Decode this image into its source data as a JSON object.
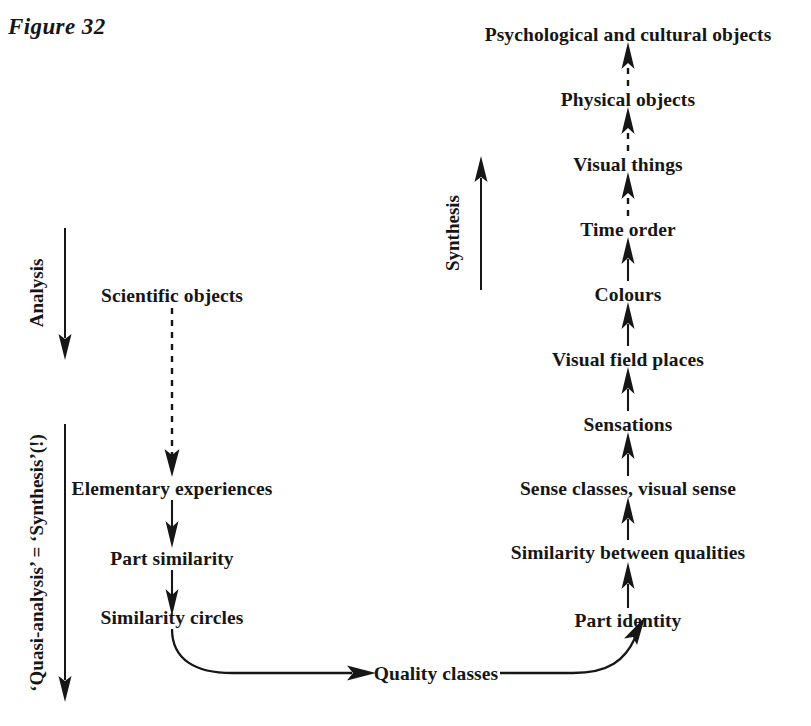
{
  "figure": {
    "title": "Figure 32",
    "background_color": "#ffffff",
    "ink_color": "#161616"
  },
  "axis_captions": [
    {
      "id": "analysis",
      "label": "Analysis",
      "direction": "down",
      "arrow_style": "solid"
    },
    {
      "id": "quasi-analysis",
      "label": "‘Quasi-analysis’ = ‘Synthesis’(!)",
      "direction": "down",
      "arrow_style": "solid"
    },
    {
      "id": "synthesis",
      "label": "Synthesis",
      "direction": "up",
      "arrow_style": "solid"
    }
  ],
  "left_column": {
    "name": "analysis-chain",
    "nodes": [
      {
        "id": "scientific-objects",
        "label": "Scientific objects"
      },
      {
        "id": "elementary-experiences",
        "label": "Elementary experiences"
      },
      {
        "id": "part-similarity",
        "label": "Part similarity"
      },
      {
        "id": "similarity-circles",
        "label": "Similarity circles"
      }
    ],
    "edges": [
      {
        "from": "scientific-objects",
        "to": "elementary-experiences",
        "style": "dashed",
        "direction": "down"
      },
      {
        "from": "elementary-experiences",
        "to": "part-similarity",
        "style": "solid",
        "direction": "down"
      },
      {
        "from": "part-similarity",
        "to": "similarity-circles",
        "style": "solid",
        "direction": "down"
      }
    ]
  },
  "bridge": {
    "node": {
      "id": "quality-classes",
      "label": "Quality classes"
    },
    "edges": [
      {
        "from": "similarity-circles",
        "to": "quality-classes",
        "style": "solid",
        "direction": "curve-right"
      },
      {
        "from": "quality-classes",
        "to": "part-identity",
        "style": "solid",
        "direction": "curve-up-right"
      }
    ]
  },
  "right_column": {
    "name": "synthesis-chain",
    "nodes": [
      {
        "id": "part-identity",
        "label": "Part identity"
      },
      {
        "id": "similarity-between-qualities",
        "label": "Similarity between qualities"
      },
      {
        "id": "sense-classes-visual-sense",
        "label": "Sense classes, visual sense"
      },
      {
        "id": "sensations",
        "label": "Sensations"
      },
      {
        "id": "visual-field-places",
        "label": "Visual field places"
      },
      {
        "id": "colours",
        "label": "Colours"
      },
      {
        "id": "time-order",
        "label": "Time order"
      },
      {
        "id": "visual-things",
        "label": "Visual things"
      },
      {
        "id": "physical-objects",
        "label": "Physical objects"
      },
      {
        "id": "psychological-and-cultural-objects",
        "label": "Psychological and cultural objects"
      }
    ],
    "edges": [
      {
        "from": "part-identity",
        "to": "similarity-between-qualities",
        "style": "solid",
        "direction": "up"
      },
      {
        "from": "similarity-between-qualities",
        "to": "sense-classes-visual-sense",
        "style": "solid",
        "direction": "up"
      },
      {
        "from": "sense-classes-visual-sense",
        "to": "sensations",
        "style": "solid",
        "direction": "up"
      },
      {
        "from": "sensations",
        "to": "visual-field-places",
        "style": "solid",
        "direction": "up"
      },
      {
        "from": "visual-field-places",
        "to": "colours",
        "style": "solid",
        "direction": "up"
      },
      {
        "from": "colours",
        "to": "time-order",
        "style": "solid",
        "direction": "up"
      },
      {
        "from": "time-order",
        "to": "visual-things",
        "style": "dashed",
        "direction": "up"
      },
      {
        "from": "visual-things",
        "to": "physical-objects",
        "style": "dashed",
        "direction": "up"
      },
      {
        "from": "physical-objects",
        "to": "psychological-and-cultural-objects",
        "style": "dashed",
        "direction": "up"
      }
    ]
  }
}
